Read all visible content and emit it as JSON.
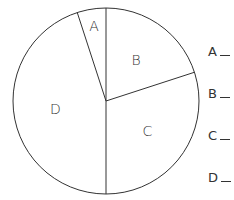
{
  "chart_data": {
    "type": "pie",
    "title": "",
    "categories": [
      "A",
      "B",
      "C",
      "D"
    ],
    "values": [
      5,
      20,
      30,
      45
    ],
    "unit": "percent (estimated from angles)",
    "start_angle_deg": -18,
    "direction": "clockwise",
    "colors": [
      "#ffffff",
      "#ffffff",
      "#ffffff",
      "#ffffff"
    ],
    "stroke": "#333333",
    "legend": {
      "position": "right",
      "entries": [
        "A",
        "B",
        "C",
        "D"
      ],
      "blank_answer_lines": true
    }
  },
  "slice_labels": [
    "A",
    "B",
    "C",
    "D"
  ],
  "legend_items": [
    "A",
    "B",
    "C",
    "D"
  ]
}
